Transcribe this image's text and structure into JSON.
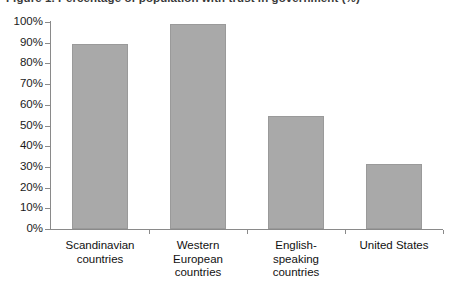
{
  "caption": {
    "text": "Figure 1. Percentage of population with trust in government (%)"
  },
  "chart_data": {
    "type": "bar",
    "title": "",
    "xlabel": "",
    "ylabel": "",
    "categories": [
      "Scandinavian countries",
      "Western European countries",
      "English-speaking countries",
      "United States"
    ],
    "category_lines": [
      [
        "Scandinavian",
        "countries"
      ],
      [
        "Western",
        "European",
        "countries"
      ],
      [
        "English-",
        "speaking",
        "countries"
      ],
      [
        "United States"
      ]
    ],
    "values": [
      89.5,
      99,
      54.5,
      31.5
    ],
    "value_unit": "%",
    "ylim": [
      0,
      100
    ],
    "ytick_values": [
      0,
      10,
      20,
      30,
      40,
      50,
      60,
      70,
      80,
      90,
      100
    ],
    "ytick_labels": [
      "0%",
      "10%",
      "20%",
      "30%",
      "40%",
      "50%",
      "60%",
      "70%",
      "80%",
      "90%",
      "100%"
    ],
    "grid": false,
    "legend": false,
    "bar_color": "#a9a9a9",
    "axis_color": "#8a8a8a",
    "text_color": "#111111"
  }
}
